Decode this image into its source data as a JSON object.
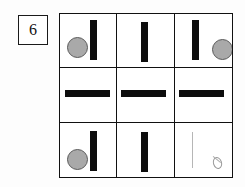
{
  "page": {
    "kind": "matrix-reasoning-item",
    "background_color": "#fdfdfd"
  },
  "item_number": {
    "label": "6"
  },
  "colors": {
    "bar_black": "#0d0d0d",
    "circle_gray": "#a9a9a9",
    "circle_outline": "#5a5a5a",
    "grid_line": "#111111",
    "sketch_gray": "#b6b6b6"
  },
  "matrix": {
    "rows": 3,
    "columns": 3,
    "cells": [
      {
        "position": "row1-col1",
        "description": "gray circle left, black vertical bar right",
        "elements": [
          "gray-circle",
          "vertical-bar"
        ]
      },
      {
        "position": "row1-col2",
        "description": "black vertical bar centered",
        "elements": [
          "vertical-bar"
        ]
      },
      {
        "position": "row1-col3",
        "description": "black vertical bar left, gray circle right",
        "elements": [
          "vertical-bar",
          "gray-circle"
        ]
      },
      {
        "position": "row2-col1",
        "description": "black horizontal bar centered",
        "elements": [
          "horizontal-bar"
        ]
      },
      {
        "position": "row2-col2",
        "description": "black horizontal bar centered",
        "elements": [
          "horizontal-bar"
        ]
      },
      {
        "position": "row2-col3",
        "description": "black horizontal bar centered",
        "elements": [
          "horizontal-bar"
        ]
      },
      {
        "position": "row3-col1",
        "description": "gray circle left, black vertical bar right",
        "elements": [
          "gray-circle",
          "vertical-bar"
        ]
      },
      {
        "position": "row3-col2",
        "description": "black vertical bar centered",
        "elements": [
          "vertical-bar"
        ]
      },
      {
        "position": "row3-col3",
        "description": "faint hand-drawn answer: thin vertical line and small oval",
        "elements": [
          "sketch-line",
          "sketch-oval"
        ]
      }
    ]
  }
}
